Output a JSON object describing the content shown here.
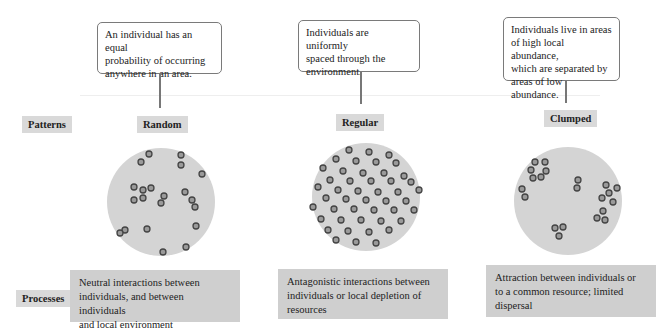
{
  "row_labels": {
    "patterns": "Patterns",
    "processes": "Processes"
  },
  "columns": [
    {
      "pattern": "Random",
      "callout": [
        "An individual has an equal",
        "probability of occurring",
        "anywhere in an area."
      ],
      "process": [
        "Neutral interactions between",
        "individuals, and between individuals",
        "and local environment"
      ]
    },
    {
      "pattern": "Regular",
      "callout": [
        "Individuals are uniformly",
        "spaced through the",
        "environment."
      ],
      "process": [
        "Antagonistic interactions between",
        "individuals or local depletion of",
        "resources"
      ]
    },
    {
      "pattern": "Clumped",
      "callout": [
        "Individuals live in areas",
        "of high local abundance,",
        "which are separated by",
        "areas of low abundance."
      ],
      "process": [
        "Attraction between individuals or",
        "to a common resource; limited",
        "dispersal"
      ]
    }
  ],
  "colors": {
    "disc": "#d4d4d4",
    "dot_fill": "#9a9a9a",
    "dot_stroke": "#444444",
    "label_bg": "#d9d9d9",
    "process_bg": "#cfcfcf"
  },
  "points": {
    "random": [
      [
        149,
        154
      ],
      [
        141,
        162
      ],
      [
        181,
        155
      ],
      [
        181,
        165
      ],
      [
        202,
        174
      ],
      [
        134,
        187
      ],
      [
        143,
        190
      ],
      [
        151,
        188
      ],
      [
        164,
        196
      ],
      [
        185,
        192
      ],
      [
        134,
        200
      ],
      [
        143,
        198
      ],
      [
        161,
        203
      ],
      [
        192,
        200
      ],
      [
        195,
        207
      ],
      [
        196,
        226
      ],
      [
        125,
        230
      ],
      [
        120,
        233
      ],
      [
        147,
        229
      ],
      [
        186,
        247
      ],
      [
        163,
        252
      ]
    ],
    "regular": [
      [
        349,
        150
      ],
      [
        369,
        152
      ],
      [
        389,
        155
      ],
      [
        336,
        159
      ],
      [
        356,
        161
      ],
      [
        376,
        162
      ],
      [
        396,
        163
      ],
      [
        323,
        168
      ],
      [
        343,
        171
      ],
      [
        363,
        173
      ],
      [
        384,
        173
      ],
      [
        404,
        176
      ],
      [
        330,
        180
      ],
      [
        350,
        181
      ],
      [
        371,
        181
      ],
      [
        391,
        181
      ],
      [
        411,
        182
      ],
      [
        318,
        187
      ],
      [
        338,
        190
      ],
      [
        358,
        191
      ],
      [
        378,
        192
      ],
      [
        398,
        192
      ],
      [
        419,
        190
      ],
      [
        326,
        198
      ],
      [
        346,
        199
      ],
      [
        366,
        200
      ],
      [
        386,
        201
      ],
      [
        406,
        201
      ],
      [
        313,
        207
      ],
      [
        334,
        209
      ],
      [
        354,
        209
      ],
      [
        374,
        210
      ],
      [
        394,
        210
      ],
      [
        414,
        210
      ],
      [
        321,
        219
      ],
      [
        341,
        220
      ],
      [
        361,
        220
      ],
      [
        381,
        221
      ],
      [
        401,
        221
      ],
      [
        328,
        230
      ],
      [
        348,
        231
      ],
      [
        369,
        232
      ],
      [
        389,
        230
      ],
      [
        336,
        240
      ],
      [
        356,
        242
      ],
      [
        376,
        243
      ]
    ]
  }
}
